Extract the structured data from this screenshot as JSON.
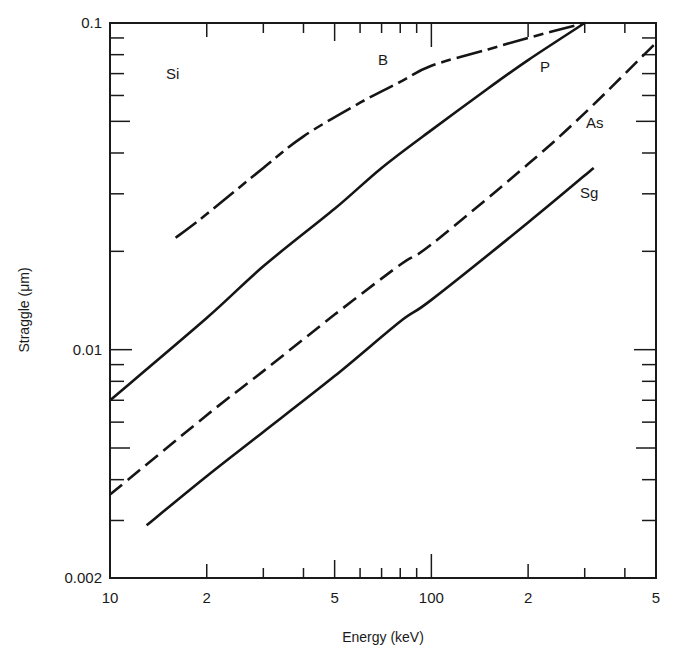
{
  "chart_data": {
    "type": "line",
    "title": "",
    "material_label": "Si",
    "xlabel": "Energy (keV)",
    "ylabel": "Straggle (μm)",
    "xscale": "log",
    "yscale": "log",
    "xlim": [
      10,
      500
    ],
    "ylim": [
      0.002,
      0.1
    ],
    "grid": false,
    "legend": "inline labels next to curves",
    "x_tick_labels": [
      {
        "value": 10,
        "label": "10"
      },
      {
        "value": 20,
        "label": "2"
      },
      {
        "value": 50,
        "label": "5"
      },
      {
        "value": 100,
        "label": "100"
      },
      {
        "value": 200,
        "label": "2"
      },
      {
        "value": 500,
        "label": "5"
      }
    ],
    "y_tick_labels": [
      {
        "value": 0.1,
        "label": "0.1"
      },
      {
        "value": 0.01,
        "label": "0.01"
      },
      {
        "value": 0.002,
        "label": "0.002"
      }
    ],
    "series": [
      {
        "name": "B",
        "style": "long-short dash",
        "x": [
          16,
          20,
          30,
          40,
          60,
          80,
          100,
          150,
          200,
          300
        ],
        "y": [
          0.022,
          0.026,
          0.036,
          0.045,
          0.057,
          0.066,
          0.074,
          0.083,
          0.09,
          0.1
        ]
      },
      {
        "name": "P",
        "style": "solid",
        "x": [
          10,
          20,
          30,
          50,
          70,
          100,
          150,
          200,
          300
        ],
        "y": [
          0.007,
          0.0125,
          0.018,
          0.027,
          0.036,
          0.047,
          0.063,
          0.077,
          0.1
        ]
      },
      {
        "name": "As",
        "style": "dashed",
        "x": [
          10,
          20,
          30,
          50,
          80,
          100,
          200,
          300,
          500
        ],
        "y": [
          0.0036,
          0.0063,
          0.0086,
          0.0128,
          0.0182,
          0.021,
          0.037,
          0.053,
          0.087
        ]
      },
      {
        "name": "Sg",
        "style": "solid",
        "x": [
          13,
          20,
          30,
          50,
          80,
          100,
          200,
          320
        ],
        "y": [
          0.0029,
          0.0041,
          0.0056,
          0.0083,
          0.0122,
          0.0142,
          0.0245,
          0.036
        ]
      }
    ]
  }
}
